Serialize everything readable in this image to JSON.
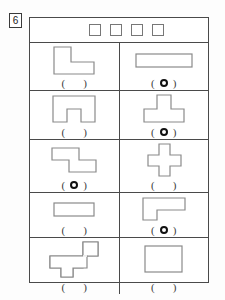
{
  "worksheet": {
    "question_number": "6",
    "header": {
      "checkbox_count": 4,
      "boxes": [
        "box-1",
        "box-2",
        "box-3",
        "box-4"
      ]
    },
    "answer_paren_left": "(",
    "answer_paren_right": ")",
    "marker_icon": "filled-ring-marker",
    "stroke_color": "#4a4a4a",
    "shape_stroke_color": "#8a8a8a",
    "marker_color": "#111111",
    "rows": [
      {
        "row_index": 1,
        "cells": [
          {
            "position": "left",
            "shape_name": "l-shape",
            "marked": false,
            "answer_text": "(        )"
          },
          {
            "position": "right",
            "shape_name": "wide-rectangle",
            "marked": true,
            "answer_text": "(   O   )"
          }
        ]
      },
      {
        "row_index": 2,
        "cells": [
          {
            "position": "left",
            "shape_name": "u-arch-shape",
            "marked": false,
            "answer_text": "(        )"
          },
          {
            "position": "right",
            "shape_name": "t-shape",
            "marked": true,
            "answer_text": "(   O   )"
          }
        ]
      },
      {
        "row_index": 3,
        "cells": [
          {
            "position": "left",
            "shape_name": "s-zigzag-shape",
            "marked": true,
            "answer_text": "(   O   )"
          },
          {
            "position": "right",
            "shape_name": "plus-cross-shape",
            "marked": false,
            "answer_text": "(        )"
          }
        ]
      },
      {
        "row_index": 4,
        "cells": [
          {
            "position": "left",
            "shape_name": "small-wide-rectangle",
            "marked": false,
            "answer_text": "(        )"
          },
          {
            "position": "right",
            "shape_name": "reversed-l-shape",
            "marked": true,
            "answer_text": "(   O   )"
          }
        ]
      },
      {
        "row_index": 5,
        "cells": [
          {
            "position": "left",
            "shape_name": "complex-polyomino-shape",
            "marked": false,
            "answer_text": "(        )"
          },
          {
            "position": "right",
            "shape_name": "tall-rectangle",
            "marked": false,
            "answer_text": "(        )"
          }
        ]
      }
    ]
  }
}
